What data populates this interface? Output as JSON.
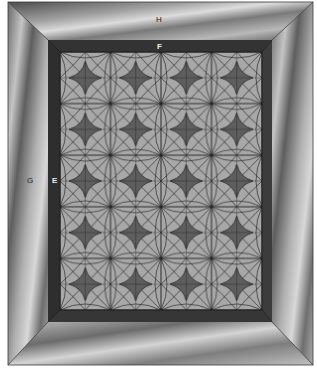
{
  "diagram": {
    "type": "quilt-layout",
    "labels": {
      "H": "H",
      "F": "F",
      "G": "G",
      "E": "E"
    },
    "layout": {
      "outer_border": {
        "label": "H/G",
        "description": "wide outer border with mitered corners"
      },
      "inner_border": {
        "label": "F/E",
        "description": "narrow dark inner border with mitered corners"
      },
      "center": {
        "columns": 4,
        "rows": 5,
        "block": "four-point star within curved-petal lattice"
      }
    },
    "colors": {
      "background": "#ffffff",
      "outer_border_light": "#c8c8c8",
      "outer_border_dark": "#5a5a5a",
      "inner_border": "#3a3a3a",
      "block_light": "#a8a8a8",
      "star": "#5e5e5e",
      "lines": "#2a2a2a"
    }
  }
}
